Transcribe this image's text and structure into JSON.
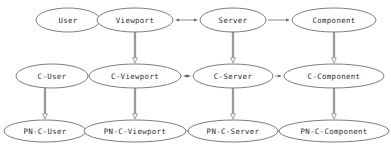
{
  "diagram": {
    "type": "directed-graph",
    "background_color": "#ffffff",
    "node_fill_color": "#ffffff",
    "node_stroke_color": "#6e6e6e",
    "label_color": "#2b2b2b",
    "edge_color": "#8a8a8a",
    "vertical_edge_color": "#9a9a9a",
    "rows": [
      {
        "row_id": "abstract",
        "nodes": [
          {
            "id": "user",
            "label": "User",
            "cx": 68,
            "cy": 20,
            "rx": 32,
            "ry": 12
          },
          {
            "id": "viewport",
            "label": "Viewport",
            "cx": 135,
            "cy": 20,
            "rx": 38,
            "ry": 12
          },
          {
            "id": "server",
            "label": "Server",
            "cx": 233,
            "cy": 20,
            "rx": 33,
            "ry": 12
          },
          {
            "id": "component",
            "label": "Component",
            "cx": 334,
            "cy": 20,
            "rx": 42,
            "ry": 12
          }
        ]
      },
      {
        "row_id": "c-layer",
        "nodes": [
          {
            "id": "c-user",
            "label": "C-User",
            "cx": 52,
            "cy": 76,
            "rx": 36,
            "ry": 12
          },
          {
            "id": "c-viewport",
            "label": "C-Viewport",
            "cx": 135,
            "cy": 76,
            "rx": 46,
            "ry": 12
          },
          {
            "id": "c-server",
            "label": "C-Server",
            "cx": 233,
            "cy": 76,
            "rx": 40,
            "ry": 12
          },
          {
            "id": "c-component",
            "label": "C-Component",
            "cx": 334,
            "cy": 76,
            "rx": 50,
            "ry": 12
          }
        ]
      },
      {
        "row_id": "pn-c-layer",
        "nodes": [
          {
            "id": "pn-c-user",
            "label": "PN-C-User",
            "cx": 45,
            "cy": 131,
            "rx": 41,
            "ry": 11
          },
          {
            "id": "pn-c-viewport",
            "label": "PN-C-Viewport",
            "cx": 135,
            "cy": 131,
            "rx": 51,
            "ry": 11
          },
          {
            "id": "pn-c-server",
            "label": "PN-C-Server",
            "cx": 233,
            "cy": 131,
            "rx": 45,
            "ry": 11
          },
          {
            "id": "pn-c-component",
            "label": "PN-C-Component",
            "cx": 334,
            "cy": 131,
            "rx": 55,
            "ry": 11
          }
        ]
      }
    ],
    "horizontal_edges": [
      {
        "id": "user-to-viewport",
        "from": "user",
        "to": "viewport",
        "x1": 101,
        "x2": 96,
        "y": 20,
        "direction": "forward"
      },
      {
        "id": "viewport-to-server",
        "from": "viewport",
        "to": "server",
        "x1": 174,
        "x2": 199,
        "y": 20,
        "direction": "both"
      },
      {
        "id": "server-to-component",
        "from": "server",
        "to": "component",
        "x1": 267,
        "x2": 291,
        "y": 20,
        "direction": "forward"
      },
      {
        "id": "cuser-to-cviewport",
        "from": "c-user",
        "to": "c-viewport",
        "x1": 89,
        "x2": 88,
        "y": 76,
        "direction": "forward"
      },
      {
        "id": "cviewport-to-cserver",
        "from": "c-viewport",
        "to": "c-server",
        "x1": 182,
        "x2": 192,
        "y": 76,
        "direction": "both"
      },
      {
        "id": "cserver-to-ccomponent",
        "from": "c-server",
        "to": "c-component",
        "x1": 274,
        "x2": 283,
        "y": 76,
        "direction": "forward"
      },
      {
        "id": "pncuser-to-pncviewport",
        "from": "pn-c-user",
        "to": "pn-c-viewport",
        "x1": 87,
        "x2": 83,
        "y": 131,
        "direction": "forward"
      },
      {
        "id": "pncviewport-to-pncserver",
        "from": "pn-c-viewport",
        "to": "pn-c-server",
        "x1": 187,
        "x2": 187,
        "y": 131,
        "direction": "both"
      },
      {
        "id": "pncserver-to-pnccomponent",
        "from": "pn-c-server",
        "to": "pn-c-component",
        "x1": 279,
        "x2": 278,
        "y": 131,
        "direction": "forward"
      }
    ],
    "vertical_edges": [
      {
        "id": "viewport-to-cviewport",
        "from": "viewport",
        "to": "c-viewport",
        "x": 135,
        "y1": 32,
        "y2": 63
      },
      {
        "id": "server-to-cserver",
        "from": "server",
        "to": "c-server",
        "x": 233,
        "y1": 32,
        "y2": 63
      },
      {
        "id": "component-to-ccomponent",
        "from": "component",
        "to": "c-component",
        "x": 334,
        "y1": 32,
        "y2": 63
      },
      {
        "id": "cuser-to-pncuser",
        "from": "c-user",
        "to": "pn-c-user",
        "x": 45,
        "y1": 88,
        "y2": 119
      },
      {
        "id": "cviewport-to-pncviewport",
        "from": "c-viewport",
        "to": "pn-c-viewport",
        "x": 135,
        "y1": 88,
        "y2": 119
      },
      {
        "id": "cserver-to-pncserver",
        "from": "c-server",
        "to": "pn-c-server",
        "x": 233,
        "y1": 88,
        "y2": 119
      },
      {
        "id": "ccomponent-to-pnccomponent",
        "from": "c-component",
        "to": "pn-c-component",
        "x": 334,
        "y1": 88,
        "y2": 119
      }
    ]
  }
}
